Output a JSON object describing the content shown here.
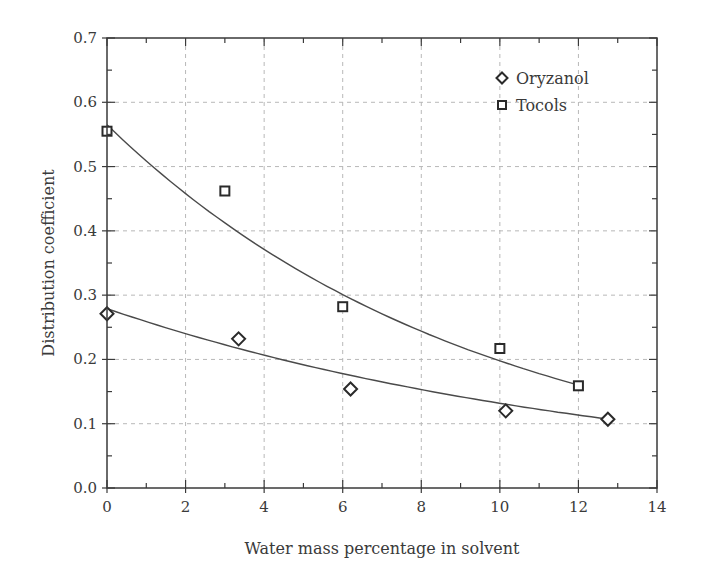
{
  "chart_data": {
    "type": "scatter",
    "title": "",
    "xlabel": "Water mass percentage in solvent",
    "ylabel": "Distribution coefficient",
    "xlim": [
      0,
      14
    ],
    "ylim": [
      0.0,
      0.7
    ],
    "x_ticks": [
      0,
      2,
      4,
      6,
      8,
      10,
      12,
      14
    ],
    "x_tick_labels": [
      "0",
      "2",
      "4",
      "6",
      "8",
      "10",
      "12",
      "14"
    ],
    "y_ticks": [
      0.0,
      0.1,
      0.2,
      0.3,
      0.4,
      0.5,
      0.6,
      0.7
    ],
    "y_tick_labels": [
      "0.0",
      "0.1",
      "0.2",
      "0.3",
      "0.4",
      "0.5",
      "0.6",
      "0.7"
    ],
    "grid": true,
    "legend_position": "upper right",
    "series": [
      {
        "name": "Oryzanol",
        "marker": "diamond",
        "x": [
          0,
          3.35,
          6.2,
          10.15,
          12.75
        ],
        "y": [
          0.271,
          0.232,
          0.154,
          0.12,
          0.107
        ],
        "fit": {
          "type": "exponential",
          "a": 0.279,
          "k": 0.075,
          "x_range": [
            0,
            12.75
          ]
        }
      },
      {
        "name": "Tocols",
        "marker": "square",
        "x": [
          0,
          3,
          6,
          10,
          12
        ],
        "y": [
          0.555,
          0.462,
          0.282,
          0.217,
          0.159
        ],
        "fit": {
          "type": "exponential",
          "a": 0.565,
          "k": 0.105,
          "x_range": [
            0,
            12
          ]
        }
      }
    ]
  },
  "legend": {
    "items": [
      {
        "label": "Oryzanol",
        "marker": "diamond"
      },
      {
        "label": "Tocols",
        "marker": "square"
      }
    ]
  },
  "colors": {
    "axis": "#3a3a3a",
    "grid": "#b8b8b8",
    "marker": "#2a2a2a",
    "fit_line": "#4a4a4a"
  }
}
